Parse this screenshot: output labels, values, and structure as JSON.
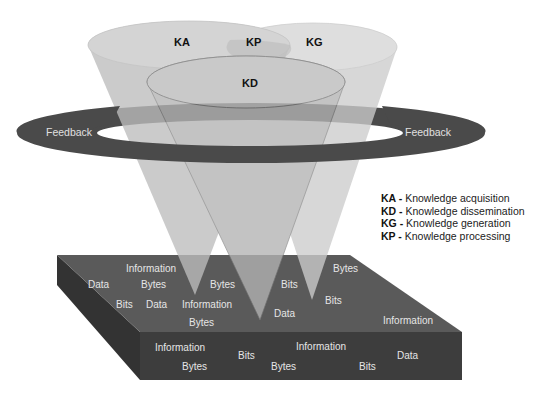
{
  "diagram": {
    "cones": [
      {
        "id": "KA",
        "label": "KA",
        "fill": "#bdbdbd"
      },
      {
        "id": "KP",
        "label": "KP"
      },
      {
        "id": "KG",
        "label": "KG",
        "fill": "#cccccc"
      },
      {
        "id": "KD",
        "label": "KD",
        "fill": "#b3b3b3"
      }
    ],
    "ring": {
      "left_label": "Feedback",
      "right_label": "Feedback",
      "color": "#4a4a4a"
    },
    "slab": {
      "top_color": "#5a5a5a",
      "front_color": "#3d3d3d",
      "side_color": "#333333",
      "top_words": [
        {
          "text": "Information",
          "x": 126,
          "y": 272
        },
        {
          "text": "Data",
          "x": 88,
          "y": 288
        },
        {
          "text": "Bytes",
          "x": 141,
          "y": 288
        },
        {
          "text": "Bits",
          "x": 116,
          "y": 308
        },
        {
          "text": "Data",
          "x": 146,
          "y": 308
        },
        {
          "text": "Bytes",
          "x": 210,
          "y": 288
        },
        {
          "text": "Information",
          "x": 182,
          "y": 308
        },
        {
          "text": "Bytes",
          "x": 189,
          "y": 326
        },
        {
          "text": "Bits",
          "x": 281,
          "y": 288
        },
        {
          "text": "Bytes",
          "x": 333,
          "y": 272
        },
        {
          "text": "Bits",
          "x": 325,
          "y": 304
        },
        {
          "text": "Data",
          "x": 274,
          "y": 317
        },
        {
          "text": "Information",
          "x": 383,
          "y": 324
        }
      ],
      "front_words": [
        {
          "text": "Information",
          "x": 155,
          "y": 351
        },
        {
          "text": "Bits",
          "x": 238,
          "y": 359
        },
        {
          "text": "Information",
          "x": 296,
          "y": 350
        },
        {
          "text": "Data",
          "x": 397,
          "y": 359
        },
        {
          "text": "Bytes",
          "x": 182,
          "y": 370
        },
        {
          "text": "Bytes",
          "x": 271,
          "y": 370
        },
        {
          "text": "Bits",
          "x": 359,
          "y": 370
        }
      ]
    },
    "legend": [
      {
        "key": "KA",
        "sep": " - ",
        "text": "Knowledge acquisition"
      },
      {
        "key": "KD",
        "sep": " - ",
        "text": "Knowledge dissemination"
      },
      {
        "key": "KG",
        "sep": " - ",
        "text": "Knowledge generation"
      },
      {
        "key": "KP",
        "sep": " - ",
        "text": "Knowledge processing"
      }
    ]
  }
}
